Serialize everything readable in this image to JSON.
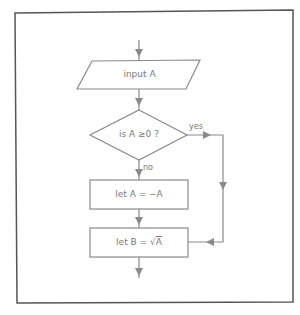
{
  "diagram": {
    "type": "flowchart",
    "colors": {
      "frame": "#555555",
      "stroke": "#8a8a8a",
      "text": "#7a7a7a",
      "background": "#ffffff"
    },
    "nodes": {
      "input": {
        "shape": "parallelogram",
        "label": "input A"
      },
      "decision": {
        "shape": "diamond",
        "label": "is A ≥0 ?"
      },
      "negate": {
        "shape": "rectangle",
        "label": "let A = −A"
      },
      "sqrt": {
        "shape": "rectangle",
        "label_prefix": "let B = √",
        "label_arg": "A"
      }
    },
    "edges": {
      "yes_label": "yes",
      "no_label": "no"
    }
  }
}
